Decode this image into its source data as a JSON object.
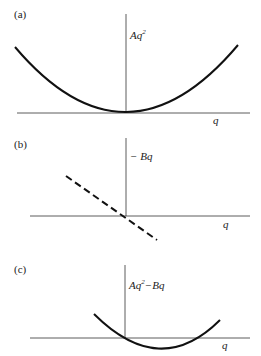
{
  "panels": [
    {
      "id": "a",
      "label": "(a)",
      "y_label": "Aq",
      "y_sup": "2",
      "y_rest": "",
      "x_label": "q",
      "curve": "parabola Aq^2"
    },
    {
      "id": "b",
      "label": "(b)",
      "y_label": "− Bq",
      "x_label": "q",
      "curve": "dashed line -Bq"
    },
    {
      "id": "c",
      "label": "(c)",
      "y_label": "Aq",
      "y_sup": "2",
      "y_rest": "−Bq",
      "x_label": "q",
      "curve": "parabola Aq^2 - Bq"
    }
  ]
}
